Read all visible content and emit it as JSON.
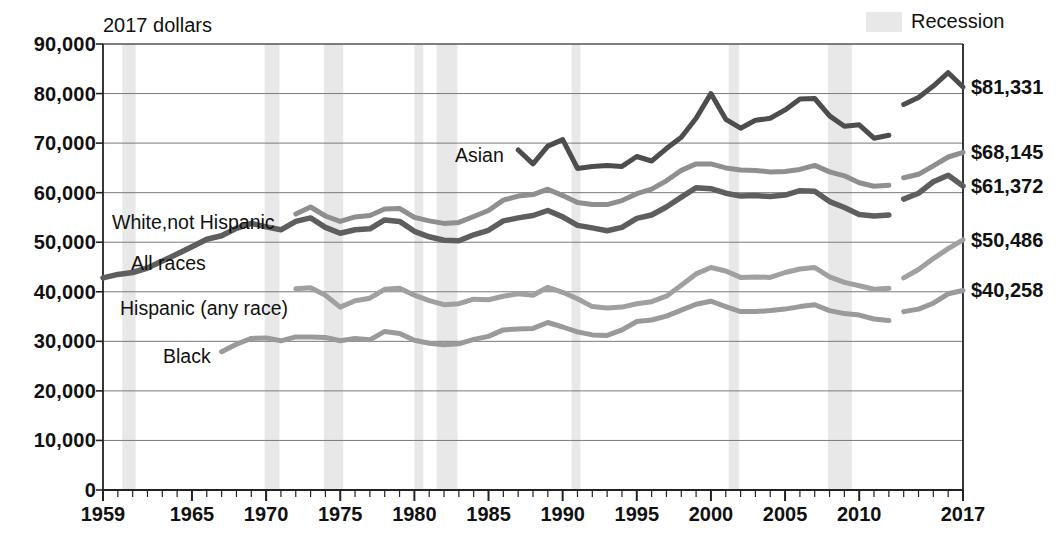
{
  "axis_note": "2017 dollars",
  "legend": {
    "recession_label": "Recession",
    "recession_color": "#e8e8e8"
  },
  "y_axis": {
    "ticks": [
      "90,000",
      "80,000",
      "70,000",
      "60,000",
      "50,000",
      "40,000",
      "30,000",
      "20,000",
      "10,000",
      "0"
    ],
    "min": 0,
    "max": 90000
  },
  "x_axis": {
    "ticks": [
      "1959",
      "1965",
      "1970",
      "1975",
      "1980",
      "1985",
      "1990",
      "1995",
      "2000",
      "2005",
      "2010",
      "2017"
    ],
    "min": 1959,
    "max": 2017
  },
  "end_labels": [
    {
      "name": "asian-end-label",
      "text": "$81,331",
      "value": 81331
    },
    {
      "name": "white-end-label",
      "text": "$68,145",
      "value": 68145
    },
    {
      "name": "all-races-end-label",
      "text": "$61,372",
      "value": 61372
    },
    {
      "name": "hispanic-end-label",
      "text": "$50,486",
      "value": 50486
    },
    {
      "name": "black-end-label",
      "text": "$40,258",
      "value": 40258
    }
  ],
  "series_labels": [
    {
      "name": "asian-series-label",
      "text": "Asian"
    },
    {
      "name": "white-series-label",
      "text": "White,not Hispanic"
    },
    {
      "name": "all-races-series-label",
      "text": "All races"
    },
    {
      "name": "hispanic-series-label",
      "text": "Hispanic (any race)"
    },
    {
      "name": "black-series-label",
      "text": "Black"
    }
  ],
  "chart_data": {
    "type": "line",
    "title": "",
    "subtitle": "",
    "xlabel": "",
    "ylabel": "2017 dollars",
    "xlim": [
      1959,
      2017
    ],
    "ylim": [
      0,
      90000
    ],
    "grid": true,
    "legend_position": "top-right",
    "annotations": [
      "Asian",
      "White,not Hispanic",
      "All races",
      "Hispanic (any race)",
      "Black"
    ],
    "recessions": [
      {
        "start": 1960.3,
        "end": 1961.2
      },
      {
        "start": 1969.9,
        "end": 1970.9
      },
      {
        "start": 1973.9,
        "end": 1975.2
      },
      {
        "start": 1980.0,
        "end": 1980.6
      },
      {
        "start": 1981.5,
        "end": 1982.9
      },
      {
        "start": 1990.6,
        "end": 1991.2
      },
      {
        "start": 2001.2,
        "end": 2001.9
      },
      {
        "start": 2007.9,
        "end": 2009.5
      }
    ],
    "series": [
      {
        "name": "Asian",
        "color": "#4d4d4d",
        "width": 5,
        "x": [
          1987,
          1988,
          1989,
          1990,
          1991,
          1992,
          1993,
          1994,
          1995,
          1996,
          1997,
          1998,
          1999,
          2000,
          2001,
          2002,
          2003,
          2004,
          2005,
          2006,
          2007,
          2008,
          2009,
          2010,
          2011,
          2012,
          2013,
          2014,
          2015,
          2016,
          2017
        ],
        "values": [
          68600,
          65800,
          69400,
          70700,
          64900,
          65300,
          65500,
          65300,
          67300,
          66400,
          68900,
          71200,
          75000,
          80000,
          74800,
          73000,
          74600,
          75000,
          76700,
          78900,
          79000,
          75500,
          73400,
          73700,
          71000,
          71600,
          77800,
          79200,
          81500,
          84200,
          81331
        ]
      },
      {
        "name": "White, not Hispanic",
        "color": "#8f8f8f",
        "width": 5,
        "x": [
          1972,
          1973,
          1974,
          1975,
          1976,
          1977,
          1978,
          1979,
          1980,
          1981,
          1982,
          1983,
          1984,
          1985,
          1986,
          1987,
          1988,
          1989,
          1990,
          1991,
          1992,
          1993,
          1994,
          1995,
          1996,
          1997,
          1998,
          1999,
          2000,
          2001,
          2002,
          2003,
          2004,
          2005,
          2006,
          2007,
          2008,
          2009,
          2010,
          2011,
          2012,
          2013,
          2014,
          2015,
          2016,
          2017
        ],
        "values": [
          55700,
          57100,
          55300,
          54200,
          55100,
          55400,
          56700,
          56800,
          55000,
          54300,
          53800,
          54000,
          55200,
          56400,
          58500,
          59300,
          59600,
          60700,
          59400,
          58000,
          57600,
          57600,
          58400,
          59800,
          60700,
          62400,
          64500,
          65800,
          65800,
          65000,
          64600,
          64500,
          64200,
          64300,
          64700,
          65500,
          64200,
          63400,
          62000,
          61300,
          61500,
          63000,
          63700,
          65400,
          67200,
          68145
        ]
      },
      {
        "name": "All races",
        "color": "#5e5e5e",
        "width": 5.5,
        "x": [
          1959,
          1960,
          1961,
          1962,
          1963,
          1964,
          1965,
          1966,
          1967,
          1968,
          1969,
          1970,
          1971,
          1972,
          1973,
          1974,
          1975,
          1976,
          1977,
          1978,
          1979,
          1980,
          1981,
          1982,
          1983,
          1984,
          1985,
          1986,
          1987,
          1988,
          1989,
          1990,
          1991,
          1992,
          1993,
          1994,
          1995,
          1996,
          1997,
          1998,
          1999,
          2000,
          2001,
          2002,
          2003,
          2004,
          2005,
          2006,
          2007,
          2008,
          2009,
          2010,
          2011,
          2012,
          2013,
          2014,
          2015,
          2016,
          2017
        ],
        "values": [
          42800,
          43500,
          43900,
          44800,
          46200,
          47600,
          49100,
          50600,
          51300,
          52800,
          53800,
          53100,
          52500,
          54200,
          54900,
          53000,
          51800,
          52500,
          52700,
          54500,
          54200,
          52200,
          51100,
          50400,
          50300,
          51500,
          52400,
          54300,
          54900,
          55400,
          56400,
          55100,
          53400,
          52900,
          52300,
          53000,
          54800,
          55500,
          57100,
          59100,
          61000,
          60800,
          59900,
          59300,
          59400,
          59200,
          59500,
          60400,
          60300,
          58200,
          57000,
          55600,
          55300,
          55500,
          58700,
          59900,
          62200,
          63500,
          61372
        ]
      },
      {
        "name": "Hispanic (any race)",
        "color": "#a0a0a0",
        "width": 5,
        "x": [
          1972,
          1973,
          1974,
          1975,
          1976,
          1977,
          1978,
          1979,
          1980,
          1981,
          1982,
          1983,
          1984,
          1985,
          1986,
          1987,
          1988,
          1989,
          1990,
          1991,
          1992,
          1993,
          1994,
          1995,
          1996,
          1997,
          1998,
          1999,
          2000,
          2001,
          2002,
          2003,
          2004,
          2005,
          2006,
          2007,
          2008,
          2009,
          2010,
          2011,
          2012,
          2013,
          2014,
          2015,
          2016,
          2017
        ],
        "values": [
          40600,
          40800,
          39300,
          36900,
          38200,
          38700,
          40500,
          40700,
          39300,
          38200,
          37400,
          37600,
          38500,
          38400,
          39100,
          39600,
          39300,
          40900,
          39900,
          38600,
          37000,
          36700,
          36900,
          37600,
          38000,
          39100,
          41300,
          43600,
          44900,
          44200,
          42900,
          43000,
          42900,
          43900,
          44600,
          44900,
          43000,
          41900,
          41200,
          40500,
          40700,
          42800,
          44500,
          46700,
          48700,
          50486
        ]
      },
      {
        "name": "Black",
        "color": "#9a9a9a",
        "width": 5,
        "x": [
          1967,
          1968,
          1969,
          1970,
          1971,
          1972,
          1973,
          1974,
          1975,
          1976,
          1977,
          1978,
          1979,
          1980,
          1981,
          1982,
          1983,
          1984,
          1985,
          1986,
          1987,
          1988,
          1989,
          1990,
          1991,
          1992,
          1993,
          1994,
          1995,
          1996,
          1997,
          1998,
          1999,
          2000,
          2001,
          2002,
          2003,
          2004,
          2005,
          2006,
          2007,
          2008,
          2009,
          2010,
          2011,
          2012,
          2013,
          2014,
          2015,
          2016,
          2017
        ],
        "values": [
          27900,
          29400,
          30600,
          30700,
          30100,
          30900,
          30900,
          30800,
          30100,
          30600,
          30300,
          32000,
          31600,
          30200,
          29600,
          29300,
          29500,
          30400,
          31000,
          32300,
          32500,
          32600,
          33800,
          32900,
          31900,
          31300,
          31200,
          32300,
          34000,
          34300,
          35100,
          36300,
          37500,
          38100,
          37000,
          36000,
          36000,
          36200,
          36500,
          37000,
          37400,
          36200,
          35600,
          35300,
          34500,
          34200,
          36000,
          36500,
          37700,
          39600,
          40258
        ]
      }
    ]
  }
}
